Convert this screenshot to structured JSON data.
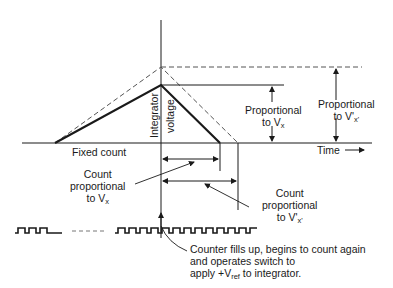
{
  "diagram": {
    "type": "dual-slope integrating ADC timing diagram",
    "axis": {
      "vertical_label_line1": "Integrator",
      "vertical_label_line2": "voltage",
      "time_label": "Time",
      "time_arrow": "→"
    },
    "labels": {
      "fixed_count": "Fixed count",
      "prop_vx": {
        "line1": "Proportional",
        "line2_prefix": "to V",
        "line2_sub": "x"
      },
      "prop_vx_prime": {
        "line1": "Proportional",
        "line2_prefix": "to V'",
        "line2_sub": "x'"
      },
      "count_vx": {
        "line1": "Count",
        "line2": "proportional",
        "line3_prefix": "to V",
        "line3_sub": "x"
      },
      "count_vx_prime": {
        "line1": "Count",
        "line2": "proportional",
        "line3_prefix": "to V'",
        "line3_sub": "x'"
      },
      "counter_note": {
        "line1": "Counter fills up, begins to count again",
        "line2": "and operates switch to",
        "line3_prefix": "apply +V",
        "line3_sub": "ref",
        "line3_suffix": " to integrator."
      }
    },
    "traces": {
      "solid": {
        "name": "V_x ramp",
        "start_x": 55,
        "peak_x": 161,
        "peak_y": 85,
        "end_x": 220,
        "baseline_y": 143
      },
      "dashed": {
        "name": "V'_x' ramp",
        "start_x": 55,
        "peak_x": 161,
        "peak_y": 67,
        "end_x": 238,
        "baseline_y": 143
      }
    },
    "colors": {
      "ink": "#1a1a1a",
      "dashed": "#555555",
      "background": "#ffffff"
    }
  }
}
